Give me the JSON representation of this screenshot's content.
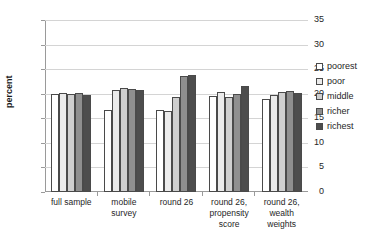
{
  "chart_data": {
    "type": "bar",
    "title": "",
    "xlabel": "",
    "ylabel": "percent",
    "ylim": [
      0,
      35
    ],
    "ytick_step": 5,
    "yticks": [
      35,
      30,
      25,
      20,
      15,
      10,
      5,
      0
    ],
    "grid": true,
    "legend_position": "right",
    "categories": [
      "full sample",
      "mobile survey",
      "round 26",
      "round 26, propensity score",
      "round 26, wealth weights"
    ],
    "category_lines": [
      [
        "full sample"
      ],
      [
        "mobile",
        "survey"
      ],
      [
        "round 26"
      ],
      [
        "round 26,",
        "propensity",
        "score"
      ],
      [
        "round 26,",
        "wealth",
        "weights"
      ]
    ],
    "series": [
      {
        "name": "poorest",
        "color": "#ffffff",
        "values": [
          20.0,
          16.6,
          16.7,
          19.5,
          18.9
        ]
      },
      {
        "name": "poor",
        "color": "#ebebeb",
        "values": [
          20.2,
          20.7,
          16.5,
          20.4,
          19.8
        ]
      },
      {
        "name": "middle",
        "color": "#cfcfcf",
        "values": [
          19.9,
          21.1,
          19.4,
          19.3,
          20.3
        ]
      },
      {
        "name": "richer",
        "color": "#8f8f8f",
        "values": [
          20.1,
          21.0,
          23.6,
          20.0,
          20.5
        ]
      },
      {
        "name": "richest",
        "color": "#4d4d4d",
        "values": [
          19.8,
          20.8,
          23.8,
          21.5,
          20.2
        ]
      }
    ]
  },
  "legend": {
    "items": [
      "poorest",
      "poor",
      "middle",
      "richer",
      "richest"
    ]
  },
  "colors": {
    "grid": "#d4d4d4",
    "axis": "#9a9a9a",
    "bar_outline": "#4a4a4a",
    "text": "#262626"
  }
}
